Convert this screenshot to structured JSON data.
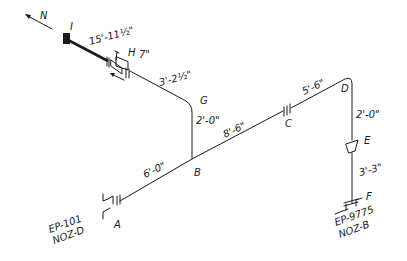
{
  "north_arrow": {
    "label": "N"
  },
  "points": {
    "A": "A",
    "B": "B",
    "C": "C",
    "D": "D",
    "E": "E",
    "F": "F",
    "G": "G",
    "H": "H",
    "I": "I"
  },
  "dimensions": {
    "I_H": "15'-11½\"",
    "H_valve": "7\"",
    "H_G": "3'-2½\"",
    "G_B": "2'-0\"",
    "A_B": "6'-0\"",
    "B_C": "8'-6\"",
    "C_D": "5'-6\"",
    "D_E": "2'-0\"",
    "E_F": "3'-3\""
  },
  "nozzles": {
    "A": {
      "equipment": "EP-101",
      "nozzle": "NOZ-D"
    },
    "F": {
      "equipment": "EP-9775",
      "nozzle": "NOZ-B"
    }
  }
}
